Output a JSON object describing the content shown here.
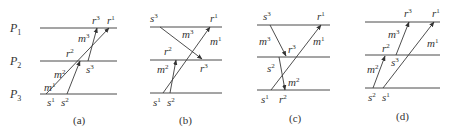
{
  "process_labels": [
    {
      "base": "P",
      "sub": "1"
    },
    {
      "base": "P",
      "sub": "2"
    },
    {
      "base": "P",
      "sub": "3"
    }
  ],
  "diagrams": [
    {
      "caption": "(a)",
      "labels": {
        "s1": {
          "base": "s",
          "sup": "1"
        },
        "s2": {
          "base": "s",
          "sup": "2"
        },
        "s3": {
          "base": "s",
          "sup": "3"
        },
        "r1": {
          "base": "r",
          "sup": "1"
        },
        "r2": {
          "base": "r",
          "sup": "2"
        },
        "r3": {
          "base": "r",
          "sup": "3"
        },
        "m1": {
          "base": "m",
          "sup": "1"
        },
        "m2": {
          "base": "m",
          "sup": "2"
        },
        "m3": {
          "base": "m",
          "sup": "3"
        }
      }
    },
    {
      "caption": "(b)",
      "labels": {
        "s1": {
          "base": "s",
          "sup": "1"
        },
        "s2": {
          "base": "s",
          "sup": "2"
        },
        "s3": {
          "base": "s",
          "sup": "3"
        },
        "r1": {
          "base": "r",
          "sup": "1"
        },
        "r2": {
          "base": "r",
          "sup": "2"
        },
        "r3": {
          "base": "r",
          "sup": "3"
        },
        "m1": {
          "base": "m",
          "sup": "1"
        },
        "m2": {
          "base": "m",
          "sup": "2"
        },
        "m3": {
          "base": "m",
          "sup": "3"
        }
      }
    },
    {
      "caption": "(c)",
      "labels": {
        "s1": {
          "base": "s",
          "sup": "1"
        },
        "s2": {
          "base": "s",
          "sup": "2"
        },
        "s3": {
          "base": "s",
          "sup": "3"
        },
        "r1": {
          "base": "r",
          "sup": "1"
        },
        "r2": {
          "base": "r",
          "sup": "2"
        },
        "r3": {
          "base": "r",
          "sup": "3"
        },
        "m1": {
          "base": "m",
          "sup": "1"
        },
        "m2": {
          "base": "m",
          "sup": "2"
        },
        "m3": {
          "base": "m",
          "sup": "3"
        }
      }
    },
    {
      "caption": "(d)",
      "labels": {
        "s1": {
          "base": "s",
          "sup": "1"
        },
        "s2": {
          "base": "s",
          "sup": "2"
        },
        "s3": {
          "base": "s",
          "sup": "3"
        },
        "r1": {
          "base": "r",
          "sup": "1"
        },
        "r2": {
          "base": "r",
          "sup": "2"
        },
        "r3": {
          "base": "r",
          "sup": "3"
        },
        "m1": {
          "base": "m",
          "sup": "1"
        },
        "m2": {
          "base": "m",
          "sup": "2"
        },
        "m3": {
          "base": "m",
          "sup": "3"
        }
      }
    }
  ]
}
